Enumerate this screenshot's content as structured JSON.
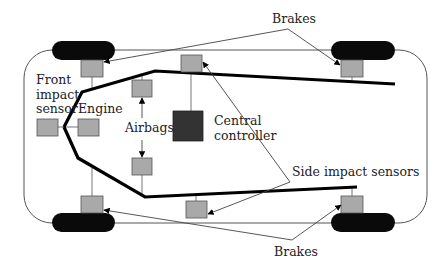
{
  "diagram": {
    "labels": {
      "brakes_top": "Brakes",
      "brakes_bottom": "Brakes",
      "front_line1": "Front",
      "front_line2": "impact",
      "front_line3": "sensor",
      "engine": "Engine",
      "airbags": "Airbags",
      "central_line1": "Central",
      "central_line2": "controller",
      "side_sensors": "Side impact sensors"
    },
    "components": [
      {
        "name": "Brake (front-left)",
        "type": "sensor-box"
      },
      {
        "name": "Brake (front-right)",
        "type": "sensor-box"
      },
      {
        "name": "Brake (rear-left)",
        "type": "sensor-box"
      },
      {
        "name": "Brake (rear-right)",
        "type": "sensor-box"
      },
      {
        "name": "Front impact sensor",
        "type": "sensor-box"
      },
      {
        "name": "Engine",
        "type": "sensor-box"
      },
      {
        "name": "Airbag (upper)",
        "type": "sensor-box"
      },
      {
        "name": "Airbag (lower)",
        "type": "sensor-box"
      },
      {
        "name": "Side impact sensor (upper)",
        "type": "sensor-box"
      },
      {
        "name": "Side impact sensor (lower)",
        "type": "sensor-box"
      },
      {
        "name": "Central controller",
        "type": "controller"
      }
    ],
    "colors": {
      "box_fill": "#a9a9a9",
      "controller_fill": "#333333",
      "wheel_fill": "#0a0a0a",
      "bus_line": "#000000",
      "outline": "#444444"
    }
  }
}
